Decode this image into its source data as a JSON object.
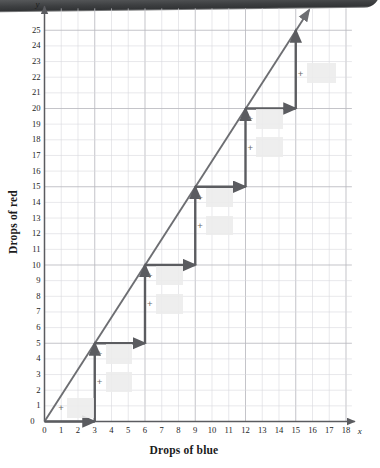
{
  "figure": {
    "x_axis_title": "Drops of blue",
    "y_axis_title": "Drops of red",
    "x_var": "x",
    "y_var": "y"
  },
  "chart_data": {
    "type": "line",
    "title": "",
    "xlabel": "Drops of blue",
    "ylabel": "Drops of red",
    "xlim": [
      0,
      18
    ],
    "ylim": [
      0,
      25
    ],
    "grid": true,
    "legend": "none",
    "x_ticks": [
      0,
      1,
      2,
      3,
      4,
      5,
      6,
      7,
      8,
      9,
      10,
      11,
      12,
      13,
      14,
      15,
      16,
      17,
      18
    ],
    "y_ticks": [
      0,
      1,
      2,
      3,
      4,
      5,
      6,
      7,
      8,
      9,
      10,
      11,
      12,
      13,
      14,
      15,
      16,
      17,
      18,
      19,
      20,
      21,
      22,
      23,
      24,
      25
    ],
    "series": [
      {
        "name": "proportional-line",
        "description": "Straight ray through origin with slope 5/3 (rise 5 over run 3), drawn with arrowhead past (15,25).",
        "slope": 1.6667,
        "intercept": 0,
        "points": [
          [
            0,
            0
          ],
          [
            3,
            5
          ],
          [
            6,
            10
          ],
          [
            9,
            15
          ],
          [
            12,
            20
          ],
          [
            15,
            25
          ]
        ],
        "arrow_end": [
          15.8,
          26.3
        ]
      },
      {
        "name": "staircase",
        "description": "Slope staircase: run of 3 right then rise of 5 up, repeated.",
        "run": 3,
        "rise": 5,
        "vertices": [
          [
            0,
            0
          ],
          [
            3,
            0
          ],
          [
            3,
            5
          ],
          [
            6,
            5
          ],
          [
            6,
            10
          ],
          [
            9,
            10
          ],
          [
            9,
            15
          ],
          [
            12,
            15
          ],
          [
            12,
            20
          ],
          [
            15,
            20
          ],
          [
            15,
            25
          ]
        ]
      }
    ],
    "annotations": [
      {
        "label": "+",
        "x": 1.0,
        "y": 0.85,
        "box": {
          "x": 1.35,
          "y": 0.25,
          "w": 1.6,
          "h": 1.25
        }
      },
      {
        "label": "+",
        "x": 3.3,
        "y": 2.5,
        "box": {
          "x": 3.65,
          "y": 1.9,
          "w": 1.6,
          "h": 1.25
        }
      },
      {
        "label": "+",
        "x": 3.3,
        "y": 4.3,
        "box": {
          "x": 3.65,
          "y": 3.7,
          "w": 1.6,
          "h": 1.25
        }
      },
      {
        "label": "+",
        "x": 6.3,
        "y": 7.5,
        "box": {
          "x": 6.65,
          "y": 6.9,
          "w": 1.6,
          "h": 1.25
        }
      },
      {
        "label": "+",
        "x": 6.3,
        "y": 9.3,
        "box": {
          "x": 6.65,
          "y": 8.7,
          "w": 1.6,
          "h": 1.25
        }
      },
      {
        "label": "+",
        "x": 9.3,
        "y": 12.5,
        "box": {
          "x": 9.65,
          "y": 11.9,
          "w": 1.6,
          "h": 1.25
        }
      },
      {
        "label": "+",
        "x": 9.3,
        "y": 14.3,
        "box": {
          "x": 9.65,
          "y": 13.7,
          "w": 1.6,
          "h": 1.25
        }
      },
      {
        "label": "+",
        "x": 12.3,
        "y": 17.5,
        "box": {
          "x": 12.65,
          "y": 16.9,
          "w": 1.6,
          "h": 1.25
        }
      },
      {
        "label": "+",
        "x": 12.3,
        "y": 19.3,
        "box": {
          "x": 12.65,
          "y": 18.7,
          "w": 1.6,
          "h": 1.25
        }
      },
      {
        "label": "+",
        "x": 15.3,
        "y": 22.2,
        "box": {
          "x": 15.7,
          "y": 21.6,
          "w": 1.7,
          "h": 1.3
        }
      }
    ],
    "colors": {
      "line": "#6d6e72",
      "staircase": "#5b5c60",
      "grid_minor": "#d9d9dd",
      "grid_major": "#b9b9bf",
      "axis": "#5b5c60",
      "blank_box": "#ececec",
      "text": "#1d1d1d"
    }
  }
}
